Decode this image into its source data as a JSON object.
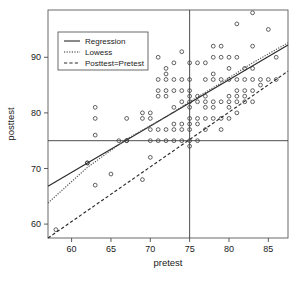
{
  "chart_data": {
    "type": "scatter",
    "title": "",
    "xlabel": "pretest",
    "ylabel": "posttest",
    "xlim": [
      57,
      87.5
    ],
    "ylim": [
      57.5,
      98.5
    ],
    "xticks": [
      60,
      65,
      70,
      75,
      80,
      85
    ],
    "yticks": [
      60,
      70,
      80,
      90
    ],
    "grid": false,
    "marker": "open-circle",
    "points": [
      [
        58,
        59
      ],
      [
        62,
        71
      ],
      [
        62,
        71
      ],
      [
        63,
        67
      ],
      [
        63,
        76
      ],
      [
        63,
        79
      ],
      [
        63,
        81
      ],
      [
        65,
        69
      ],
      [
        66,
        75
      ],
      [
        67,
        75
      ],
      [
        67,
        75
      ],
      [
        67,
        79
      ],
      [
        69,
        68
      ],
      [
        69,
        79
      ],
      [
        69,
        80
      ],
      [
        70,
        72
      ],
      [
        70,
        75
      ],
      [
        70,
        77
      ],
      [
        70,
        79
      ],
      [
        70,
        80
      ],
      [
        71,
        75
      ],
      [
        71,
        77
      ],
      [
        71,
        83
      ],
      [
        71,
        84
      ],
      [
        71,
        86
      ],
      [
        71,
        90
      ],
      [
        72,
        75
      ],
      [
        72,
        77
      ],
      [
        72,
        83
      ],
      [
        72,
        84
      ],
      [
        72,
        86
      ],
      [
        72,
        87
      ],
      [
        72,
        88
      ],
      [
        73,
        75
      ],
      [
        73,
        77
      ],
      [
        73,
        78
      ],
      [
        73,
        81
      ],
      [
        73,
        84
      ],
      [
        73,
        86
      ],
      [
        73,
        89
      ],
      [
        74,
        75
      ],
      [
        74,
        77
      ],
      [
        74,
        78
      ],
      [
        74,
        82
      ],
      [
        74,
        84
      ],
      [
        74,
        86
      ],
      [
        74,
        91
      ],
      [
        75,
        74
      ],
      [
        75,
        75
      ],
      [
        75,
        77
      ],
      [
        75,
        78
      ],
      [
        75,
        79
      ],
      [
        75,
        81
      ],
      [
        75,
        82
      ],
      [
        75,
        83
      ],
      [
        75,
        84
      ],
      [
        75,
        86
      ],
      [
        75,
        89
      ],
      [
        76,
        75
      ],
      [
        76,
        78
      ],
      [
        76,
        79
      ],
      [
        76,
        82
      ],
      [
        76,
        83
      ],
      [
        76,
        89
      ],
      [
        77,
        77
      ],
      [
        77,
        79
      ],
      [
        77,
        81
      ],
      [
        77,
        82
      ],
      [
        77,
        83
      ],
      [
        77,
        86
      ],
      [
        77,
        89
      ],
      [
        78,
        79
      ],
      [
        78,
        81
      ],
      [
        78,
        82
      ],
      [
        78,
        86
      ],
      [
        78,
        87
      ],
      [
        78,
        90
      ],
      [
        78,
        92
      ],
      [
        79,
        77
      ],
      [
        79,
        79
      ],
      [
        79,
        82
      ],
      [
        79,
        86
      ],
      [
        79,
        90
      ],
      [
        79,
        92
      ],
      [
        80,
        79
      ],
      [
        80,
        81
      ],
      [
        80,
        82
      ],
      [
        80,
        83
      ],
      [
        80,
        86
      ],
      [
        80,
        88
      ],
      [
        80,
        90
      ],
      [
        81,
        80
      ],
      [
        81,
        82
      ],
      [
        81,
        83
      ],
      [
        81,
        84
      ],
      [
        81,
        86
      ],
      [
        81,
        90
      ],
      [
        81,
        96
      ],
      [
        82,
        82
      ],
      [
        82,
        83
      ],
      [
        82,
        84
      ],
      [
        82,
        86
      ],
      [
        82,
        88
      ],
      [
        83,
        82
      ],
      [
        83,
        84
      ],
      [
        83,
        86
      ],
      [
        83,
        88
      ],
      [
        83,
        92
      ],
      [
        83,
        98
      ],
      [
        84,
        85
      ],
      [
        84,
        86
      ],
      [
        85,
        86
      ],
      [
        85,
        95
      ],
      [
        86,
        86
      ],
      [
        86,
        90
      ]
    ],
    "series": [
      {
        "name": "Regression",
        "style": "solid",
        "color": "#2a2a2a",
        "x": [
          57,
          87.5
        ],
        "y": [
          66.8,
          92.2
        ]
      },
      {
        "name": "Lowess",
        "style": "dotted",
        "color": "#555555",
        "x": [
          57,
          62,
          67,
          72,
          75,
          79,
          83,
          87.5
        ],
        "y": [
          63.8,
          70.2,
          75.3,
          79.3,
          82.0,
          85.4,
          89.0,
          92.6
        ]
      },
      {
        "name": "Posttest=Pretest",
        "style": "dashed",
        "color": "#2a2a2a",
        "x": [
          57,
          87.5
        ],
        "y": [
          57.5,
          87.5
        ]
      }
    ],
    "reference_lines": [
      {
        "orientation": "horizontal",
        "value": 75,
        "color": "#3a3a3a"
      },
      {
        "orientation": "vertical",
        "value": 75,
        "color": "#3a3a3a"
      }
    ],
    "legend": {
      "position": "top-left",
      "entries": [
        {
          "label": "Regression",
          "style": "solid"
        },
        {
          "label": "Lowess",
          "style": "dotted"
        },
        {
          "label": "Posttest=Pretest",
          "style": "dashed"
        }
      ]
    }
  }
}
